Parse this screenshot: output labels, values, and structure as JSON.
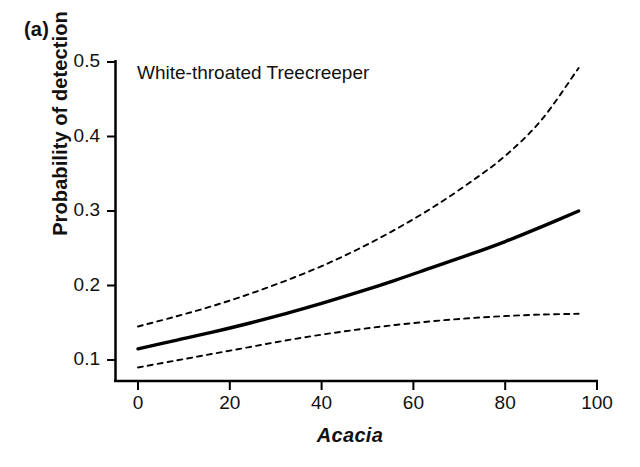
{
  "figure": {
    "panel_label": "(a)",
    "background_color": "#ffffff",
    "ink_color": "#000000"
  },
  "chart_data": {
    "type": "line",
    "title": "White-throated Treecreeper",
    "xlabel": "Acacia",
    "ylabel": "Probability of detection",
    "xlim": [
      -4,
      100
    ],
    "ylim": [
      0.08,
      0.5
    ],
    "grid": false,
    "legend": "none",
    "xticks": [
      0,
      20,
      40,
      60,
      80,
      100
    ],
    "xtick_labels": [
      "0",
      "20",
      "40",
      "60",
      "80",
      "100"
    ],
    "yticks": [
      0.1,
      0.2,
      0.3,
      0.4,
      0.5
    ],
    "ytick_labels": [
      "0.1",
      "0.2",
      "0.3",
      "0.4",
      "0.5"
    ],
    "x": [
      0,
      8,
      16,
      24,
      32,
      40,
      48,
      56,
      64,
      72,
      80,
      88,
      96
    ],
    "series": [
      {
        "name": "Predicted probability of detection",
        "style": "solid",
        "values": [
          0.115,
          0.126,
          0.137,
          0.149,
          0.162,
          0.176,
          0.191,
          0.207,
          0.224,
          0.241,
          0.259,
          0.279,
          0.3
        ]
      },
      {
        "name": "Upper 95% confidence limit",
        "style": "dashed",
        "values": [
          0.145,
          0.158,
          0.172,
          0.188,
          0.206,
          0.226,
          0.249,
          0.275,
          0.304,
          0.337,
          0.374,
          0.423,
          0.492
        ]
      },
      {
        "name": "Lower 95% confidence limit",
        "style": "dashed",
        "values": [
          0.09,
          0.099,
          0.108,
          0.117,
          0.126,
          0.134,
          0.141,
          0.147,
          0.152,
          0.156,
          0.159,
          0.161,
          0.162
        ]
      }
    ]
  }
}
